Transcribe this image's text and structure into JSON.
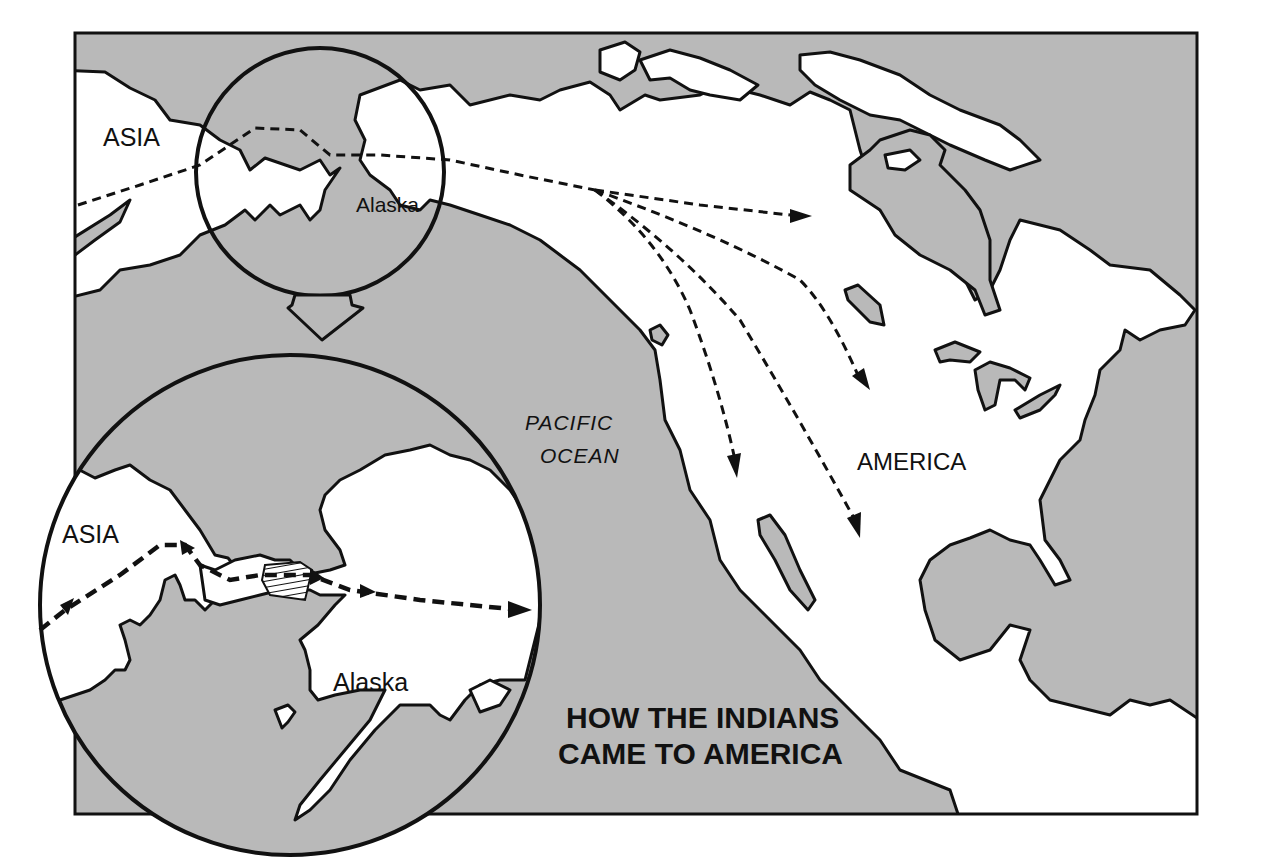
{
  "map": {
    "title_line1": "HOW THE INDIANS",
    "title_line2": "CAME TO AMERICA",
    "labels": {
      "asia_main": "ASIA",
      "alaska_main": "Alaska",
      "pacific_line1": "PACIFIC",
      "pacific_line2": "OCEAN",
      "america": "AMERICA",
      "asia_inset": "ASIA",
      "alaska_inset": "Alaska"
    },
    "colors": {
      "ocean": "#b9b9b9",
      "land": "#ffffff",
      "outline": "#111111"
    },
    "elements": {
      "small_circle": "Bering Strait region locator circle",
      "large_circle": "Enlarged inset of Bering land bridge",
      "arrow_down": "Zoom indicator arrow",
      "routes": "Dashed migration routes from Asia across Alaska into America"
    }
  }
}
